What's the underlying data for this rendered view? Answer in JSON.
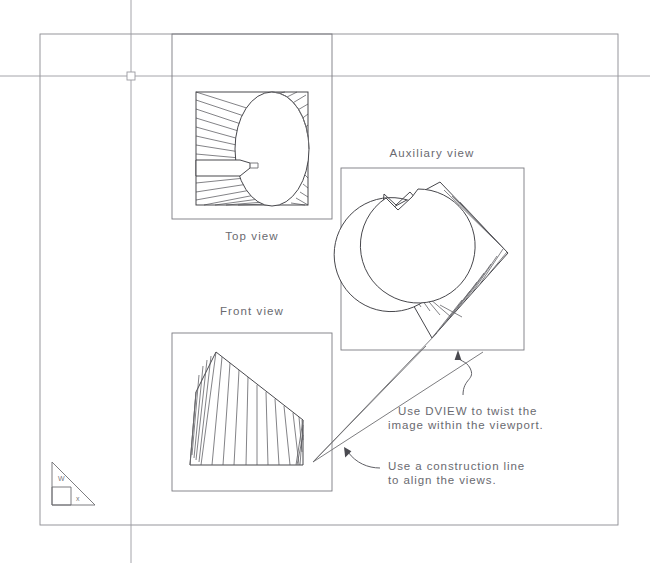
{
  "drawing": {
    "title": "AutoCAD paper space layout with three viewports",
    "background_color": "#ffffff",
    "line_color": "#6e6e72",
    "text_color": "#6a6a70"
  },
  "labels": {
    "top_view": "Top view",
    "front_view": "Front view",
    "auxiliary_view": "Auxiliary view"
  },
  "notes": {
    "dview": {
      "line1": "Use DVIEW to twist the",
      "line2": "image within the viewport."
    },
    "construction": {
      "line1": "Use a construction line",
      "line2": "to align the views."
    }
  },
  "ucs_icon": {
    "y_axis_label": "W",
    "x_axis_label": "x"
  },
  "viewports": [
    {
      "name": "top-view-viewport",
      "label": "Top view",
      "x": 172,
      "y": 34,
      "width": 160,
      "height": 185
    },
    {
      "name": "auxiliary-view-viewport",
      "label": "Auxiliary view",
      "x": 341,
      "y": 168,
      "width": 183,
      "height": 182
    },
    {
      "name": "front-view-viewport",
      "label": "Front view",
      "x": 172,
      "y": 333,
      "width": 160,
      "height": 158
    }
  ],
  "cursor": {
    "name": "crosshair-cursor",
    "x": 131,
    "y": 76,
    "pickbox_size": 8
  },
  "paper_frame": {
    "x": 40,
    "y": 34,
    "width": 578,
    "height": 491
  }
}
